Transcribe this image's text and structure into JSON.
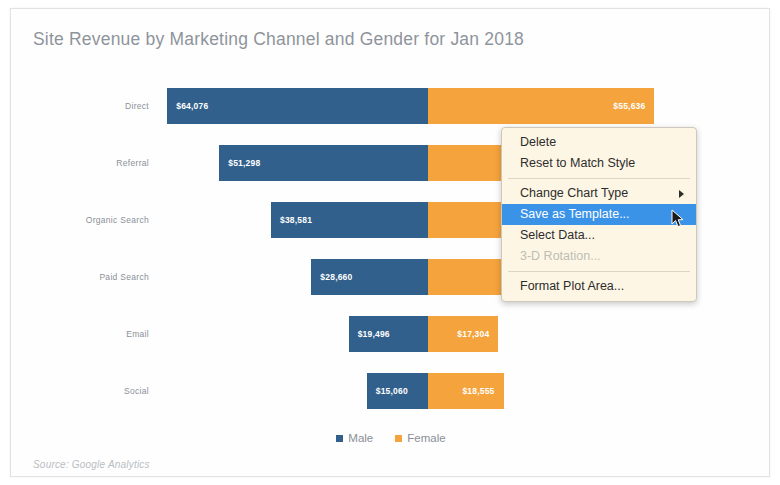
{
  "slide": {
    "title": "Site Revenue by Marketing Channel and Gender for Jan 2018",
    "source_note": "Source: Google Analytics"
  },
  "colors": {
    "male": "#31608c",
    "female": "#f5a33c",
    "title_text": "#8e949b",
    "axis_text": "#8a9096",
    "menu_background": "#fdf6e4",
    "menu_highlight": "#3b93e8"
  },
  "chart_data": {
    "type": "bar",
    "subtype": "diverging-stacked-horizontal",
    "title": "Site Revenue by Marketing Channel and Gender for Jan 2018",
    "xlabel": "",
    "ylabel": "",
    "grid": false,
    "legend_position": "bottom",
    "categories": [
      "Direct",
      "Referral",
      "Organic Search",
      "Paid Search",
      "Email",
      "Social"
    ],
    "series": [
      {
        "name": "Male",
        "color": "#31608c",
        "direction": "left",
        "values": [
          64076,
          51298,
          38581,
          28660,
          19496,
          15060
        ],
        "labels": [
          "$64,076",
          "$51,298",
          "$38,581",
          "$28,660",
          "$19,496",
          "$15,060"
        ]
      },
      {
        "name": "Female",
        "color": "#f5a33c",
        "direction": "right",
        "values": [
          55636,
          35000,
          32000,
          25000,
          17304,
          18555
        ],
        "labels": [
          "$55,636",
          "",
          "",
          "",
          "$17,304",
          "$18,555"
        ]
      }
    ],
    "source": "Source: Google Analytics"
  },
  "legend": {
    "items": [
      {
        "label": "Male",
        "color": "#31608c"
      },
      {
        "label": "Female",
        "color": "#f5a33c"
      }
    ]
  },
  "context_menu": {
    "items": [
      {
        "label": "Delete",
        "state": "normal",
        "submenu": false
      },
      {
        "label": "Reset to Match Style",
        "state": "normal",
        "submenu": false
      },
      {
        "separator": true
      },
      {
        "label": "Change Chart Type",
        "state": "normal",
        "submenu": true
      },
      {
        "label": "Save as Template...",
        "state": "selected",
        "submenu": false
      },
      {
        "label": "Select Data...",
        "state": "normal",
        "submenu": false
      },
      {
        "label": "3-D Rotation...",
        "state": "disabled",
        "submenu": false
      },
      {
        "separator": true
      },
      {
        "label": "Format Plot Area...",
        "state": "normal",
        "submenu": false
      }
    ]
  }
}
